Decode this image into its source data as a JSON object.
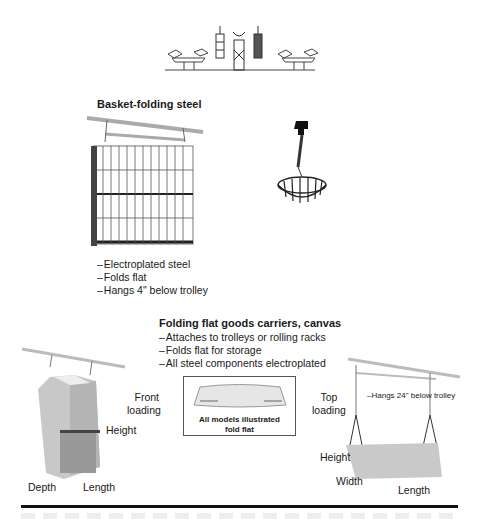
{
  "top_illustration": {
    "description": "trolley rail with folding carriers"
  },
  "basket_section": {
    "title": "Basket-folding steel",
    "bullets": [
      "Electroplated steel",
      "Folds flat",
      "Hangs 4\" below trolley"
    ]
  },
  "canvas_section": {
    "title": "Folding flat goods carriers, canvas",
    "bullets": [
      "Attaches to trolleys or rolling racks",
      "Folds flat for storage",
      "All steel components electroplated"
    ]
  },
  "front_loading": {
    "label_line1": "Front",
    "label_line2": "loading",
    "height_label": "Height",
    "depth_label": "Depth",
    "length_label": "Length"
  },
  "inset": {
    "caption_line1": "All models illustrated",
    "caption_line2": "fold flat"
  },
  "top_loading": {
    "label_line1": "Top",
    "label_line2": "loading",
    "hang_note": "–Hangs 24\" below trolley",
    "height_label": "Height",
    "width_label": "Width",
    "length_label": "Length"
  }
}
